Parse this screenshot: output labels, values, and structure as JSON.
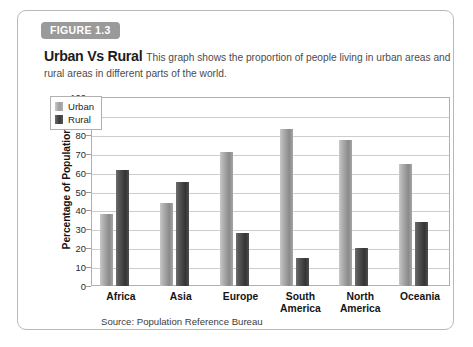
{
  "figure": {
    "tab_label": "FIGURE 1.3",
    "title": "Urban Vs Rural",
    "description": "This graph shows the proportion of people living in urban areas and rural areas in different parts of the world.",
    "source": "Source: Population Reference Bureau"
  },
  "colors": {
    "tab_background": "#9a9a9a",
    "tab_text": "#ffffff",
    "card_border": "#b9b9b9",
    "urban_bar": "#9d9d9d",
    "rural_bar": "#3b3b3b",
    "gridline": "#cdcdcd",
    "plot_border": "#b0b0b0"
  },
  "chart_data": {
    "type": "bar",
    "title": "Urban Vs Rural",
    "xlabel": "",
    "ylabel": "Percentage of Population",
    "ylim": [
      0,
      100
    ],
    "ytick_step": 10,
    "yticks": [
      100,
      90,
      80,
      70,
      60,
      50,
      40,
      30,
      20,
      10,
      0
    ],
    "grid": true,
    "legend_position": "top-left inside plot",
    "categories": [
      "Africa",
      "Asia",
      "Europe",
      "South America",
      "North America",
      "Oceania"
    ],
    "category_lines": [
      [
        "Africa"
      ],
      [
        "Asia"
      ],
      [
        "Europe"
      ],
      [
        "South",
        "America"
      ],
      [
        "North",
        "America"
      ],
      [
        "Oceania"
      ]
    ],
    "series": [
      {
        "name": "Urban",
        "values": [
          38,
          44,
          71,
          83,
          77.5,
          64.5
        ]
      },
      {
        "name": "Rural",
        "values": [
          61.5,
          55,
          28,
          15,
          20,
          34
        ]
      }
    ]
  }
}
